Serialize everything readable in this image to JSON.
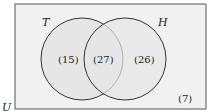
{
  "diagram": {
    "type": "venn",
    "universe_label": "U",
    "sets": [
      {
        "label": "T",
        "only_count": "(15)"
      },
      {
        "label": "H",
        "only_count": "(26)"
      }
    ],
    "intersection_count": "(27)",
    "outside_count": "(7)",
    "colors": {
      "background": "#ffffff",
      "universe_fill": "#f1f1f1",
      "circle_fill": "#e6e6e6",
      "stroke": "#333333"
    }
  }
}
